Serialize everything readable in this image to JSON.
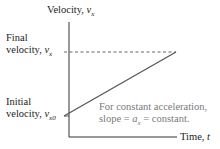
{
  "diagram": {
    "y_axis_label": "Velocity, ",
    "y_axis_var": "v",
    "y_axis_sub": "x",
    "x_axis_label": "Time, ",
    "x_axis_var": "t",
    "final_label_line1": "Final",
    "final_label_line2": "velocity, ",
    "final_var": "v",
    "final_sub": "x",
    "initial_label_line1": "Initial",
    "initial_label_line2": "velocity, ",
    "initial_var": "v",
    "initial_sub": "x0",
    "note_line1": "For constant acceleration,",
    "note_line2_prefix": "slope = ",
    "note_line2_var": "a",
    "note_line2_sub": "x",
    "note_line2_suffix": " = constant.",
    "colors": {
      "axis": "#333333",
      "line": "#555555",
      "dashed": "#666666",
      "note_text": "#7a7a7a"
    }
  }
}
